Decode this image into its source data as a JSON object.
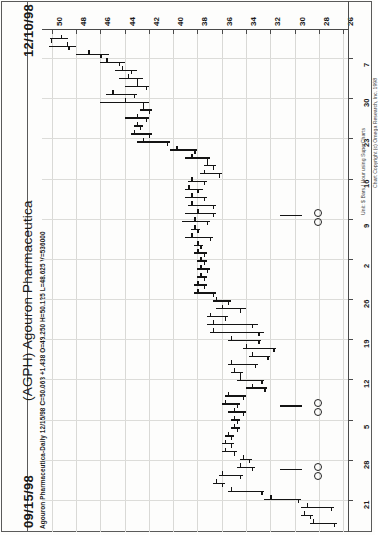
{
  "header": {
    "date_end": "12/10/98",
    "date_start": "09/15/98",
    "title": "(AGPH) Agouron Pharmaceutica",
    "quote_line": "Agouron Pharmaceutica-Daily  12/15/98  C=50.063  +1.438  O=49.250  H=50.125  L=48.625  V=536000",
    "copyright": "Chart Copyright (c) Omega Research, Inc. 1998",
    "y_unit_note": "Unit: $ Bars / Hour using SuperCharts"
  },
  "chart_data": {
    "type": "ohlc-bar",
    "title": "(AGPH) Agouron Pharmaceutica",
    "subtitle": "Agouron Pharmaceutica-Daily  12/15/98  C=50.063  +1.438  O=49.250  H=50.125  L=48.625  V=536000",
    "orientation": "rotated-90ccw",
    "xlabel": "Price",
    "ylabel": "Date",
    "price_axis": {
      "ticks": [
        50,
        48,
        46,
        44,
        42,
        40,
        38,
        36,
        34,
        32,
        30,
        28,
        26
      ],
      "range": [
        26,
        50
      ],
      "position": "top",
      "direction": "descending-left-to-right"
    },
    "date_axis": {
      "ticks": [
        "7",
        "30",
        "23",
        "16",
        "9",
        "2",
        "26",
        "19",
        "12",
        "5",
        "28",
        "21"
      ],
      "months": [
        "Dec",
        "Nov",
        "Nov",
        "Nov",
        "Nov",
        "Nov",
        "Oct",
        "Oct",
        "Oct",
        "Oct",
        "Sep",
        "Sep"
      ],
      "position": "right",
      "start": "09/15/98",
      "end": "12/10/98"
    },
    "grid": true,
    "legend": "none",
    "annotations": [
      {
        "label": "O",
        "near_date": "11/09"
      },
      {
        "label": "O",
        "near_date": "10/19"
      },
      {
        "label": "O",
        "near_date": "10/05"
      }
    ],
    "bars": [
      {
        "date": "12/10",
        "open": 49.25,
        "high": 50.13,
        "low": 48.63,
        "close": 50.06
      },
      {
        "date": "12/09",
        "open": 48.75,
        "high": 50.25,
        "low": 48.0,
        "close": 48.63
      },
      {
        "date": "12/08",
        "open": 47.0,
        "high": 48.0,
        "low": 45.25,
        "close": 46.0
      },
      {
        "date": "12/07",
        "open": 45.5,
        "high": 46.0,
        "low": 44.0,
        "close": 44.5
      },
      {
        "date": "12/04",
        "open": 44.25,
        "high": 44.75,
        "low": 43.0,
        "close": 43.5
      },
      {
        "date": "12/03",
        "open": 43.75,
        "high": 44.5,
        "low": 42.5,
        "close": 43.0
      },
      {
        "date": "12/02",
        "open": 43.0,
        "high": 44.0,
        "low": 42.0,
        "close": 42.25
      },
      {
        "date": "12/01",
        "open": 45.0,
        "high": 45.5,
        "low": 43.0,
        "close": 43.25
      },
      {
        "date": "11/30",
        "open": 44.0,
        "high": 46.0,
        "low": 42.0,
        "close": 42.5
      },
      {
        "date": "11/27",
        "open": 42.5,
        "high": 42.75,
        "low": 41.75,
        "close": 42.0
      },
      {
        "date": "11/25",
        "open": 43.0,
        "high": 44.0,
        "low": 42.0,
        "close": 42.25
      },
      {
        "date": "11/24",
        "open": 43.0,
        "high": 43.25,
        "low": 42.5,
        "close": 42.75
      },
      {
        "date": "11/23",
        "open": 43.25,
        "high": 43.5,
        "low": 41.75,
        "close": 42.0
      },
      {
        "date": "11/20",
        "open": 42.5,
        "high": 43.0,
        "low": 40.25,
        "close": 40.5
      },
      {
        "date": "11/19",
        "open": 39.75,
        "high": 40.25,
        "low": 38.0,
        "close": 38.25
      },
      {
        "date": "11/18",
        "open": 38.5,
        "high": 39.0,
        "low": 37.0,
        "close": 37.25
      },
      {
        "date": "11/17",
        "open": 37.25,
        "high": 37.5,
        "low": 36.5,
        "close": 36.75
      },
      {
        "date": "11/16",
        "open": 37.5,
        "high": 37.75,
        "low": 36.0,
        "close": 36.25
      },
      {
        "date": "11/13",
        "open": 38.5,
        "high": 38.75,
        "low": 37.25,
        "close": 37.5
      },
      {
        "date": "11/12",
        "open": 38.75,
        "high": 39.0,
        "low": 37.5,
        "close": 38.0
      },
      {
        "date": "11/11",
        "open": 38.5,
        "high": 39.0,
        "low": 37.25,
        "close": 37.5
      },
      {
        "date": "11/10",
        "open": 38.5,
        "high": 38.75,
        "low": 36.5,
        "close": 36.75
      },
      {
        "date": "11/09",
        "open": 38.0,
        "high": 39.0,
        "low": 36.5,
        "close": 36.75
      },
      {
        "date": "11/06",
        "open": 38.25,
        "high": 39.25,
        "low": 37.0,
        "close": 37.25
      },
      {
        "date": "11/05",
        "open": 38.25,
        "high": 38.5,
        "low": 37.75,
        "close": 38.0
      },
      {
        "date": "11/04",
        "open": 38.5,
        "high": 39.0,
        "low": 36.75,
        "close": 37.0
      },
      {
        "date": "11/03",
        "open": 38.0,
        "high": 38.25,
        "low": 37.5,
        "close": 37.75
      },
      {
        "date": "11/02",
        "open": 38.0,
        "high": 38.25,
        "low": 37.25,
        "close": 37.5
      },
      {
        "date": "10/30",
        "open": 37.75,
        "high": 38.0,
        "low": 37.25,
        "close": 37.5
      },
      {
        "date": "10/29",
        "open": 37.75,
        "high": 38.0,
        "low": 37.0,
        "close": 37.25
      },
      {
        "date": "10/28",
        "open": 37.75,
        "high": 38.0,
        "low": 37.25,
        "close": 37.5
      },
      {
        "date": "10/27",
        "open": 38.0,
        "high": 38.25,
        "low": 37.25,
        "close": 37.5
      },
      {
        "date": "10/26",
        "open": 38.0,
        "high": 38.25,
        "low": 36.5,
        "close": 36.75
      },
      {
        "date": "10/23",
        "open": 36.5,
        "high": 36.75,
        "low": 35.25,
        "close": 35.5
      },
      {
        "date": "10/22",
        "open": 36.0,
        "high": 36.5,
        "low": 34.0,
        "close": 34.5
      },
      {
        "date": "10/21",
        "open": 37.0,
        "high": 37.25,
        "low": 35.5,
        "close": 35.75
      },
      {
        "date": "10/20",
        "open": 36.75,
        "high": 37.25,
        "low": 33.0,
        "close": 33.5
      },
      {
        "date": "10/19",
        "open": 36.75,
        "high": 37.0,
        "low": 32.5,
        "close": 33.0
      },
      {
        "date": "10/16",
        "open": 35.25,
        "high": 35.5,
        "low": 32.75,
        "close": 33.0
      },
      {
        "date": "10/15",
        "open": 34.0,
        "high": 34.25,
        "low": 31.5,
        "close": 31.75
      },
      {
        "date": "10/14",
        "open": 33.5,
        "high": 33.75,
        "low": 32.0,
        "close": 32.25
      },
      {
        "date": "10/13",
        "open": 35.25,
        "high": 35.5,
        "low": 33.0,
        "close": 33.25
      },
      {
        "date": "10/12",
        "open": 35.0,
        "high": 35.25,
        "low": 34.25,
        "close": 34.5
      },
      {
        "date": "10/09",
        "open": 34.5,
        "high": 34.75,
        "low": 32.5,
        "close": 32.75
      },
      {
        "date": "10/08",
        "open": 33.5,
        "high": 34.0,
        "low": 32.25,
        "close": 32.5
      },
      {
        "date": "10/07",
        "open": 35.5,
        "high": 35.75,
        "low": 34.0,
        "close": 34.25
      },
      {
        "date": "10/06",
        "open": 35.75,
        "high": 36.0,
        "low": 34.5,
        "close": 34.75
      },
      {
        "date": "10/05",
        "open": 35.0,
        "high": 35.5,
        "low": 34.0,
        "close": 34.25
      },
      {
        "date": "10/02",
        "open": 35.0,
        "high": 35.25,
        "low": 34.5,
        "close": 34.75
      },
      {
        "date": "10/01",
        "open": 35.0,
        "high": 35.25,
        "low": 34.5,
        "close": 34.75
      },
      {
        "date": "09/30",
        "open": 35.5,
        "high": 35.75,
        "low": 35.0,
        "close": 35.25
      },
      {
        "date": "09/29",
        "open": 35.75,
        "high": 36.0,
        "low": 35.0,
        "close": 35.25
      },
      {
        "date": "09/28",
        "open": 35.75,
        "high": 36.0,
        "low": 34.75,
        "close": 35.0
      },
      {
        "date": "09/25",
        "open": 34.25,
        "high": 34.5,
        "low": 33.5,
        "close": 33.75
      },
      {
        "date": "09/24",
        "open": 34.5,
        "high": 34.75,
        "low": 33.25,
        "close": 33.5
      },
      {
        "date": "09/23",
        "open": 36.0,
        "high": 36.25,
        "low": 34.25,
        "close": 34.5
      },
      {
        "date": "09/22",
        "open": 36.5,
        "high": 36.75,
        "low": 35.75,
        "close": 36.0
      },
      {
        "date": "09/21",
        "open": 35.25,
        "high": 35.5,
        "low": 32.5,
        "close": 32.75
      },
      {
        "date": "09/18",
        "open": 32.0,
        "high": 32.5,
        "low": 29.5,
        "close": 29.75
      },
      {
        "date": "09/17",
        "open": 29.0,
        "high": 29.5,
        "low": 26.75,
        "close": 27.0
      },
      {
        "date": "09/16",
        "open": 29.25,
        "high": 29.5,
        "low": 28.5,
        "close": 28.75
      },
      {
        "date": "09/15",
        "open": 28.5,
        "high": 28.75,
        "low": 26.5,
        "close": 26.75
      }
    ]
  }
}
